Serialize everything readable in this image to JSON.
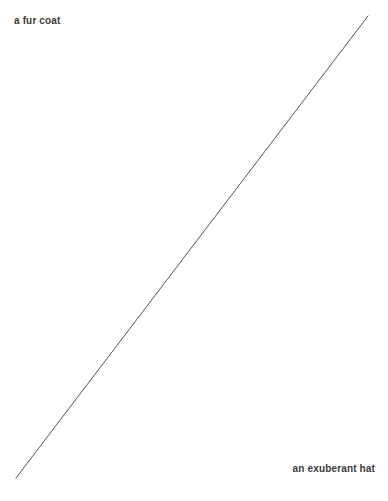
{
  "canvas": {
    "width": 388,
    "height": 501,
    "background_color": "#ffffff"
  },
  "labels": {
    "top_left": "a fur coat",
    "bottom_right": "an exuberant hat"
  },
  "style": {
    "text_color": "#3a3a3a",
    "line_color": "#555555",
    "line_width": 1
  },
  "connector": {
    "x1": 16,
    "y1": 478,
    "x2": 368,
    "y2": 16
  }
}
